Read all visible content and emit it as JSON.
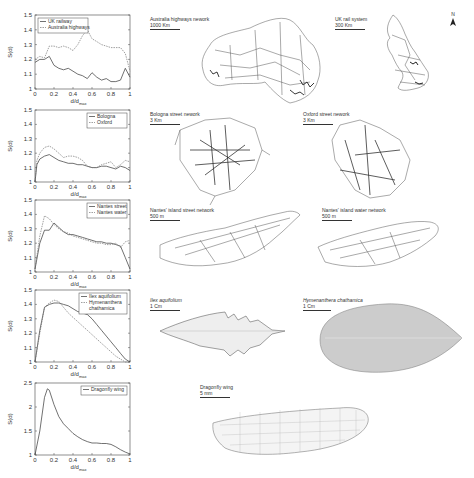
{
  "chart_data": [
    {
      "type": "line",
      "title": "",
      "xlabel": "d/d_max",
      "ylabel": "S(d)",
      "ylim": [
        1,
        1.5
      ],
      "xlim": [
        0,
        1
      ],
      "yticks": [
        "1",
        "1.1",
        "1.2",
        "1.3",
        "1.4",
        "1.5"
      ],
      "xticks": [
        "0",
        "0.2",
        "0.4",
        "0.6",
        "0.8",
        "1"
      ],
      "legend_position": "upper-left",
      "grid": false,
      "x": [
        0,
        0.05,
        0.1,
        0.15,
        0.2,
        0.25,
        0.3,
        0.35,
        0.4,
        0.45,
        0.5,
        0.55,
        0.6,
        0.65,
        0.7,
        0.75,
        0.8,
        0.85,
        0.9,
        0.95,
        1.0
      ],
      "series": [
        {
          "name": "UK railway",
          "style": "solid",
          "values": [
            1.18,
            1.2,
            1.2,
            1.22,
            1.16,
            1.14,
            1.13,
            1.14,
            1.12,
            1.1,
            1.09,
            1.07,
            1.11,
            1.08,
            1.06,
            1.07,
            1.05,
            1.05,
            1.06,
            1.14,
            1.08
          ]
        },
        {
          "name": "Australia highways",
          "style": "dashed",
          "values": [
            1.2,
            1.22,
            1.21,
            1.29,
            1.29,
            1.28,
            1.29,
            1.28,
            1.26,
            1.3,
            1.36,
            1.4,
            1.34,
            1.32,
            1.3,
            1.29,
            1.28,
            1.28,
            1.28,
            1.24,
            1.12
          ]
        }
      ]
    },
    {
      "type": "line",
      "xlabel": "d/d_max",
      "ylabel": "S(d)",
      "ylim": [
        1,
        1.5
      ],
      "xlim": [
        0,
        1
      ],
      "yticks": [
        "1",
        "1.1",
        "1.2",
        "1.3",
        "1.4",
        "1.5"
      ],
      "xticks": [
        "0",
        "0.2",
        "0.4",
        "0.6",
        "0.8",
        "1"
      ],
      "legend_position": "upper-right",
      "grid": false,
      "x": [
        0,
        0.02,
        0.05,
        0.1,
        0.15,
        0.2,
        0.25,
        0.3,
        0.35,
        0.4,
        0.45,
        0.5,
        0.55,
        0.6,
        0.65,
        0.7,
        0.75,
        0.8,
        0.85,
        0.9,
        0.95,
        1.0
      ],
      "series": [
        {
          "name": "Bologna",
          "style": "solid",
          "values": [
            1.0,
            1.12,
            1.16,
            1.18,
            1.19,
            1.17,
            1.15,
            1.14,
            1.13,
            1.13,
            1.12,
            1.12,
            1.11,
            1.1,
            1.1,
            1.11,
            1.11,
            1.1,
            1.09,
            1.11,
            1.1,
            1.08
          ]
        },
        {
          "name": "Oxford",
          "style": "dashed",
          "values": [
            1.0,
            1.15,
            1.2,
            1.24,
            1.25,
            1.23,
            1.2,
            1.17,
            1.18,
            1.18,
            1.17,
            1.15,
            1.11,
            1.1,
            1.1,
            1.12,
            1.13,
            1.14,
            1.1,
            1.12,
            1.15,
            1.14
          ]
        }
      ]
    },
    {
      "type": "line",
      "xlabel": "d/d_max",
      "ylabel": "S(d)",
      "ylim": [
        1,
        1.5
      ],
      "xlim": [
        0,
        1
      ],
      "yticks": [
        "1",
        "1.1",
        "1.2",
        "1.3",
        "1.4",
        "1.5"
      ],
      "xticks": [
        "0",
        "0.2",
        "0.4",
        "0.6",
        "0.8",
        "1"
      ],
      "legend_position": "upper-right",
      "grid": false,
      "x": [
        0,
        0.05,
        0.1,
        0.15,
        0.2,
        0.25,
        0.3,
        0.35,
        0.4,
        0.45,
        0.5,
        0.55,
        0.6,
        0.65,
        0.7,
        0.75,
        0.8,
        0.85,
        0.9,
        0.95,
        1.0
      ],
      "series": [
        {
          "name": "Nantes street",
          "style": "solid",
          "values": [
            1.02,
            1.2,
            1.29,
            1.29,
            1.34,
            1.31,
            1.28,
            1.26,
            1.26,
            1.25,
            1.24,
            1.23,
            1.22,
            1.21,
            1.21,
            1.2,
            1.2,
            1.19,
            1.18,
            1.1,
            1.02
          ]
        },
        {
          "name": "Nantes water",
          "style": "dashed",
          "values": [
            1.02,
            1.25,
            1.39,
            1.37,
            1.33,
            1.3,
            1.28,
            1.27,
            1.25,
            1.24,
            1.23,
            1.22,
            1.21,
            1.2,
            1.2,
            1.19,
            1.19,
            1.2,
            1.17,
            1.21,
            1.22
          ]
        }
      ]
    },
    {
      "type": "line",
      "xlabel": "d/d_max",
      "ylabel": "S(d)",
      "ylim": [
        1,
        1.5
      ],
      "xlim": [
        0,
        1
      ],
      "yticks": [
        "1",
        "1.1",
        "1.2",
        "1.3",
        "1.4",
        "1.5"
      ],
      "xticks": [
        "0",
        "0.2",
        "0.4",
        "0.6",
        "0.8",
        "1"
      ],
      "legend_position": "upper-right",
      "grid": false,
      "x": [
        0,
        0.05,
        0.1,
        0.15,
        0.2,
        0.25,
        0.3,
        0.35,
        0.4,
        0.45,
        0.5,
        0.55,
        0.6,
        0.65,
        0.7,
        0.75,
        0.8,
        0.85,
        0.9,
        0.95,
        1.0
      ],
      "series": [
        {
          "name": "Ilex aquifolium",
          "style": "solid",
          "values": [
            1.0,
            1.22,
            1.38,
            1.4,
            1.41,
            1.41,
            1.4,
            1.39,
            1.37,
            1.35,
            1.34,
            1.33,
            1.3,
            1.26,
            1.22,
            1.18,
            1.14,
            1.1,
            1.06,
            1.02,
            1.0
          ]
        },
        {
          "name": "Hymenanthera chathamica",
          "style": "dashed",
          "values": [
            1.0,
            1.2,
            1.38,
            1.41,
            1.43,
            1.42,
            1.38,
            1.34,
            1.31,
            1.28,
            1.25,
            1.22,
            1.19,
            1.16,
            1.13,
            1.1,
            1.07,
            1.04,
            1.02,
            1.0,
            1.0
          ]
        }
      ]
    },
    {
      "type": "line",
      "xlabel": "d/d_max",
      "ylabel": "S(d)",
      "ylim": [
        1,
        2.5
      ],
      "xlim": [
        0,
        1
      ],
      "yticks": [
        "1",
        "1.5",
        "2",
        "2.5"
      ],
      "xticks": [
        "0",
        "0.2",
        "0.4",
        "0.6",
        "0.8",
        "1"
      ],
      "legend_position": "upper-right",
      "grid": false,
      "x": [
        0,
        0.05,
        0.1,
        0.13,
        0.15,
        0.2,
        0.25,
        0.3,
        0.35,
        0.4,
        0.45,
        0.5,
        0.55,
        0.6,
        0.65,
        0.7,
        0.75,
        0.8,
        0.85,
        0.9,
        0.95,
        1.0
      ],
      "series": [
        {
          "name": "Dragonfly wing",
          "style": "solid",
          "values": [
            1.0,
            1.5,
            2.2,
            2.38,
            2.35,
            2.05,
            1.8,
            1.65,
            1.55,
            1.45,
            1.38,
            1.32,
            1.28,
            1.25,
            1.25,
            1.24,
            1.24,
            1.22,
            1.17,
            1.11,
            1.06,
            1.02
          ]
        }
      ]
    }
  ],
  "plots": [
    {
      "legend": [
        "UK railway",
        "Australia highways"
      ],
      "yticks": [
        "1.5",
        "1.4",
        "1.3",
        "1.2",
        "1.1",
        "1"
      ],
      "xticks": [
        "0",
        "0.2",
        "0.4",
        "0.6",
        "0.8",
        "1"
      ],
      "ylabel": "S(d)",
      "xlabel_main": "d/d",
      "xlabel_sub": "max"
    },
    {
      "legend": [
        "Bologna",
        "Oxford"
      ],
      "yticks": [
        "1.5",
        "1.4",
        "1.3",
        "1.2",
        "1.1",
        "1"
      ],
      "xticks": [
        "0",
        "0.2",
        "0.4",
        "0.6",
        "0.8",
        "1"
      ],
      "ylabel": "S(d)",
      "xlabel_main": "d/d",
      "xlabel_sub": "max"
    },
    {
      "legend": [
        "Nantes street",
        "Nantes water"
      ],
      "yticks": [
        "1.5",
        "1.4",
        "1.3",
        "1.2",
        "1.1",
        "1"
      ],
      "xticks": [
        "0",
        "0.2",
        "0.4",
        "0.6",
        "0.8",
        "1"
      ],
      "ylabel": "S(d)",
      "xlabel_main": "d/d",
      "xlabel_sub": "max"
    },
    {
      "legend": [
        "Ilex aquifolium",
        "Hymenanthera",
        "chathamica"
      ],
      "yticks": [
        "1.5",
        "1.4",
        "1.3",
        "1.2",
        "1.1",
        "1"
      ],
      "xticks": [
        "0",
        "0.2",
        "0.4",
        "0.6",
        "0.8",
        "1"
      ],
      "ylabel": "S(d)",
      "xlabel_main": "d/d",
      "xlabel_sub": "max"
    },
    {
      "legend": [
        "Dragonfly wing"
      ],
      "yticks": [
        "2.5",
        "2",
        "1.5",
        "1"
      ],
      "xticks": [
        "0",
        "0.2",
        "0.4",
        "0.6",
        "0.8",
        "1"
      ],
      "ylabel": "S(d)",
      "xlabel_main": "d/d",
      "xlabel_sub": "max"
    }
  ],
  "maps": {
    "australia": {
      "title": "Australia highways nework",
      "scale": "1000 Km"
    },
    "uk": {
      "title": "UK rail system",
      "scale": "300 Km"
    },
    "bologna": {
      "title": "Bologna street nework",
      "scale": "3 Km"
    },
    "oxford": {
      "title": "Oxford street nework",
      "scale": "3 Km"
    },
    "nantes_street": {
      "title": "Nantes' island street network",
      "scale": "500 m"
    },
    "nantes_water": {
      "title": "Nantes' island water network",
      "scale": "500 m"
    },
    "ilex": {
      "title": "Ilex aquifolium",
      "scale": "1 Cm"
    },
    "hymenanthera": {
      "title": "Hymenanthera chathamica",
      "scale": "1 Cm"
    },
    "dragonfly": {
      "title": "Dragonfly wing",
      "scale": "5 mm"
    },
    "north_label": "N"
  }
}
